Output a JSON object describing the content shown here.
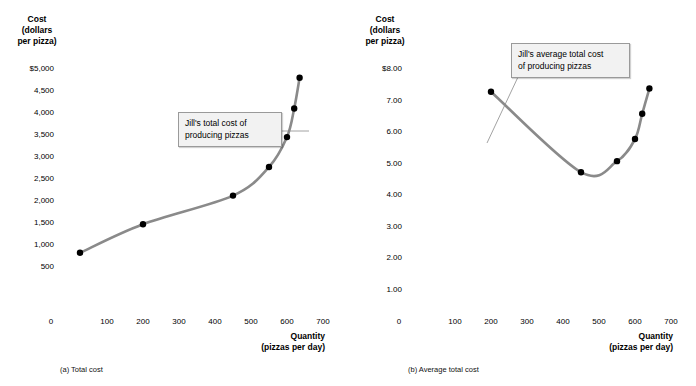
{
  "figure": {
    "panels": [
      {
        "id": "a",
        "caption": "(a) Total cost",
        "callout": "Jill's total cost of\nproducing pizzas",
        "y_axis_title": "Cost\n(dollars\nper pizza)",
        "x_axis_title": "Quantity\n(pizzas per day)",
        "y_ticks": [
          "$5,000",
          "4,500",
          "4,000",
          "3,500",
          "3,000",
          "2,500",
          "2,000",
          "1,500",
          "1,000",
          "500"
        ],
        "x_ticks": [
          "0",
          "100",
          "200",
          "300",
          "400",
          "500",
          "600",
          "700"
        ]
      },
      {
        "id": "b",
        "caption": "(b) Average total cost",
        "callout": "Jill's average total cost\nof producing pizzas",
        "y_axis_title": "Cost\n(dollars\nper pizza)",
        "x_axis_title": "Quantity\n(pizzas per day)",
        "y_ticks": [
          "$8.00",
          "7.00",
          "6.00",
          "5.00",
          "4.00",
          "3.00",
          "2.00",
          "1.00"
        ],
        "x_ticks": [
          "0",
          "100",
          "200",
          "300",
          "400",
          "500",
          "600",
          "700"
        ]
      }
    ]
  },
  "colors": {
    "curve": "#8a8a8a",
    "marker": "#000000",
    "callout_bg": "#f2f2f2",
    "callout_border": "#9a9a9a",
    "leader": "#8a8a8a"
  },
  "chart_data": [
    {
      "type": "line",
      "panel": "a",
      "title": "(a) Total cost",
      "annotation": "Jill's total cost of producing pizzas",
      "xlabel": "Quantity (pizzas per day)",
      "ylabel": "Cost (dollars per pizza)",
      "xlim": [
        0,
        700
      ],
      "ylim": [
        0,
        5000
      ],
      "xticks": [
        0,
        100,
        200,
        300,
        400,
        500,
        600,
        700
      ],
      "yticks": [
        500,
        1000,
        1500,
        2000,
        2500,
        3000,
        3500,
        4000,
        4500,
        5000
      ],
      "grid": false,
      "legend": "none",
      "series": [
        {
          "name": "Jill's total cost of producing pizzas",
          "x": [
            25,
            200,
            450,
            550,
            600,
            620,
            635
          ],
          "y": [
            800,
            1450,
            2100,
            2750,
            3430,
            4080,
            4780
          ]
        }
      ]
    },
    {
      "type": "line",
      "panel": "b",
      "title": "(b) Average total cost",
      "annotation": "Jill's average total cost of producing pizzas",
      "xlabel": "Quantity (pizzas per day)",
      "ylabel": "Cost (dollars per pizza)",
      "xlim": [
        0,
        700
      ],
      "ylim": [
        0,
        8
      ],
      "xticks": [
        0,
        100,
        200,
        300,
        400,
        500,
        600,
        700
      ],
      "yticks": [
        1,
        2,
        3,
        4,
        5,
        6,
        7,
        8
      ],
      "grid": false,
      "legend": "none",
      "series": [
        {
          "name": "Jill's average total cost of producing pizzas",
          "x": [
            200,
            450,
            550,
            600,
            620,
            640
          ],
          "y": [
            7.25,
            4.7,
            5.05,
            5.75,
            6.55,
            7.35
          ]
        }
      ]
    }
  ]
}
